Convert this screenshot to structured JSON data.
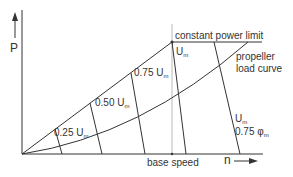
{
  "diagram": {
    "axes": {
      "y_label": "P",
      "x_label": "n"
    },
    "labels": {
      "constant_power_limit": "constant power limit",
      "propeller_line1": "propeller",
      "propeller_line2": "load curve",
      "base_speed": "base speed",
      "u025_prefix": "0.25 U",
      "u050_prefix": "0.50 U",
      "u075_prefix": "0.75 U",
      "um_prefix": "U",
      "um_field_u_prefix": "U",
      "um_field_phi_prefix": "0.75 φ",
      "subscript_m": "m"
    },
    "colors": {
      "line": "#333333",
      "background": "#ffffff",
      "guide": "#aaaaaa"
    }
  }
}
